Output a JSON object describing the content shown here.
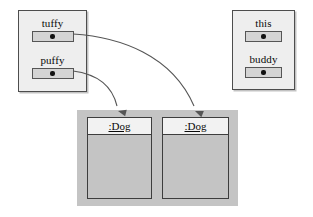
{
  "diagram": {
    "kind": "uml-object-reference-diagram",
    "canvas": {
      "width": 313,
      "height": 217,
      "background": "#ffffff"
    },
    "colors": {
      "frame_fill": "#eeeeee",
      "frame_border": "#4d4d4d",
      "slot_fill": "#d4d4d4",
      "slot_border": "#555555",
      "dot": "#111111",
      "heap_fill": "#c4c4c4",
      "object_border": "#3d3d3d",
      "object_header_fill": "#f2f2f2",
      "arrow": "#555555"
    },
    "frames": [
      {
        "name": "left-frame",
        "x": 18,
        "y": 10,
        "width": 69,
        "height": 82,
        "variables": [
          {
            "label": "tuffy",
            "label_y": 6,
            "slot_x": 14,
            "slot_y": 19,
            "slot_width": 42
          },
          {
            "label": "puffy",
            "label_y": 43,
            "slot_x": 14,
            "slot_y": 56,
            "slot_width": 42
          }
        ]
      },
      {
        "name": "right-frame",
        "x": 232,
        "y": 10,
        "width": 63,
        "height": 80,
        "variables": [
          {
            "label": "this",
            "label_y": 6,
            "slot_x": 13,
            "slot_y": 19,
            "slot_width": 37
          },
          {
            "label": "buddy",
            "label_y": 42,
            "slot_x": 13,
            "slot_y": 55,
            "slot_width": 37
          }
        ]
      }
    ],
    "heap": {
      "name": "heap-container",
      "x": 77,
      "y": 110,
      "width": 161,
      "height": 96,
      "objects": [
        {
          "title": ":Dog",
          "x": 10,
          "y": 7,
          "width": 65,
          "height": 82
        },
        {
          "title": ":Dog",
          "x": 85,
          "y": 7,
          "width": 67,
          "height": 82
        }
      ]
    },
    "arrows": [
      {
        "name": "tuffy-to-dog2",
        "from_variable": "tuffy",
        "to_object_index": 1,
        "path": "M 73,34 C 120,37 172,55 194,106",
        "head": {
          "x": 195,
          "y": 111,
          "angle": 68
        }
      },
      {
        "name": "puffy-to-dog1",
        "from_variable": "puffy",
        "to_object_index": 0,
        "path": "M 73,71 C 96,74 112,85 117,106",
        "head": {
          "x": 118,
          "y": 111,
          "angle": 76
        }
      }
    ]
  }
}
